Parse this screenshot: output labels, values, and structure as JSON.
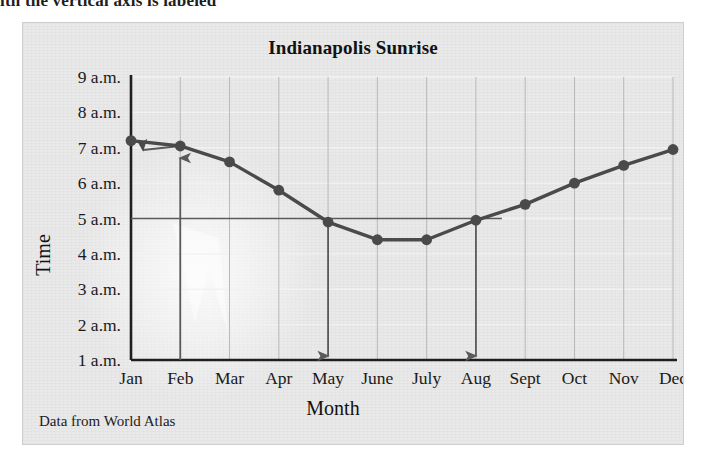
{
  "clipped_header_text": "ith the vertical axis is labeled",
  "figure": {
    "title": "Indianapolis Sunrise",
    "source_note": "Data from World Atlas",
    "x_axis_title": "Month",
    "y_axis_title": "Time"
  },
  "chart_data": {
    "type": "line",
    "title": "Indianapolis Sunrise",
    "xlabel": "Month",
    "ylabel": "Time",
    "categories": [
      "Jan",
      "Feb",
      "Mar",
      "Apr",
      "May",
      "June",
      "July",
      "Aug",
      "Sept",
      "Oct",
      "Nov",
      "Dec"
    ],
    "values": [
      7.2,
      7.05,
      6.6,
      5.8,
      4.9,
      4.4,
      4.4,
      4.95,
      5.4,
      6.0,
      6.5,
      6.95
    ],
    "y_tick_labels": [
      "9 a.m.",
      "8 a.m.",
      "7 a.m.",
      "6 a.m.",
      "5 a.m.",
      "4 a.m.",
      "3 a.m.",
      "2 a.m.",
      "1 a.m."
    ],
    "y_tick_values": [
      9,
      8,
      7,
      6,
      5,
      4,
      3,
      2,
      1
    ],
    "ylim": [
      1,
      9
    ],
    "grid": "both",
    "legend": "none",
    "series_color": "#4a4a4a",
    "marker_color": "#4a4a4a",
    "annotations": [
      {
        "name": "feb-up-arrow",
        "from_month": "Feb",
        "from_value": 1,
        "to_value": 7.05,
        "direction": "up"
      },
      {
        "name": "seven-am-left-arrow",
        "from_month": "Feb",
        "to_month": "Jan",
        "value": 7.05,
        "direction": "left"
      },
      {
        "name": "may-down-arrow",
        "from_month": "May",
        "from_value": 5,
        "to_value": 1,
        "direction": "down"
      },
      {
        "name": "aug-down-arrow",
        "from_month": "Aug",
        "from_value": 5,
        "to_value": 1,
        "direction": "down"
      },
      {
        "name": "five-am-horizontal-line",
        "value": 5,
        "from_month": "Jan",
        "to_month": "Aug"
      }
    ]
  },
  "colors": {
    "panel_background": "#e9e9e9",
    "axis": "#1f1f1f",
    "gridline": "#b8b8b8",
    "data_line": "#4a4a4a",
    "annotation": "#5a5a5a"
  }
}
